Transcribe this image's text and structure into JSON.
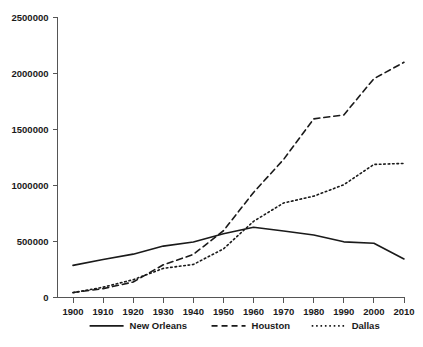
{
  "chart_data": {
    "type": "line",
    "title": "",
    "xlabel": "",
    "ylabel": "",
    "x": [
      1900,
      1910,
      1920,
      1930,
      1940,
      1950,
      1960,
      1970,
      1980,
      1990,
      2000,
      2010
    ],
    "xlim": [
      1900,
      2010
    ],
    "ylim": [
      0,
      2500000
    ],
    "grid": false,
    "legend_position": "bottom",
    "xtick_labels": [
      "1900",
      "1910",
      "1920",
      "1930",
      "1940",
      "1950",
      "1960",
      "1970",
      "1980",
      "1990",
      "2000",
      "2010"
    ],
    "ytick_labels": [
      "0",
      "500000",
      "1000000",
      "1500000",
      "2000000",
      "2500000"
    ],
    "ytick_values": [
      0,
      500000,
      1000000,
      1500000,
      2000000,
      2500000
    ],
    "series": [
      {
        "name": "New Orleans",
        "style": "solid",
        "color": "#1a1a1a",
        "values": [
          287000,
          339000,
          387000,
          459000,
          495000,
          570000,
          627000,
          593000,
          558000,
          497000,
          485000,
          344000
        ]
      },
      {
        "name": "Houston",
        "style": "dashed",
        "color": "#1a1a1a",
        "values": [
          45000,
          79000,
          138000,
          292000,
          385000,
          596000,
          938000,
          1233000,
          1595000,
          1630000,
          1954000,
          2100000
        ]
      },
      {
        "name": "Dallas",
        "style": "dotted",
        "color": "#1a1a1a",
        "values": [
          43000,
          92000,
          159000,
          260000,
          295000,
          434000,
          680000,
          844000,
          905000,
          1007000,
          1188000,
          1197000
        ]
      }
    ]
  },
  "legend": {
    "items": [
      {
        "label": "New Orleans",
        "style": "solid"
      },
      {
        "label": "Houston",
        "style": "dashed"
      },
      {
        "label": "Dallas",
        "style": "dotted"
      }
    ]
  },
  "colors": {
    "ink": "#1a1a1a",
    "axis": "#555555",
    "background": "#ffffff"
  }
}
